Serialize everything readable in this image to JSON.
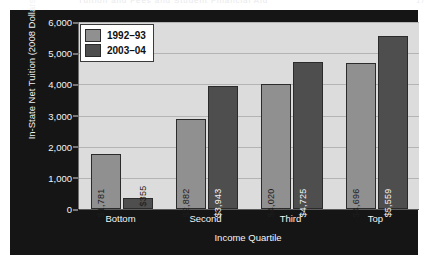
{
  "page_header": {
    "title": "Tuition and Fees and Student Financial Aid",
    "folio": "17"
  },
  "chart_data": {
    "type": "bar",
    "title": "",
    "subtitle": "",
    "xlabel": "Income Quartile",
    "ylabel": "In-State Net Tuition (2008 Dollars)",
    "categories": [
      "Bottom",
      "Second",
      "Third",
      "Top"
    ],
    "ylim": [
      0,
      6000
    ],
    "ytick_values": [
      0,
      1000,
      2000,
      3000,
      4000,
      5000,
      6000
    ],
    "ytick_labels": [
      "0",
      "1,000",
      "2,000",
      "3,000",
      "4,000",
      "5,000",
      "6,000"
    ],
    "grid": true,
    "legend_position": "top-left",
    "series": [
      {
        "name": "1992–93",
        "color": "#909090",
        "values": [
          1781,
          2882,
          4020,
          4696
        ],
        "labels": [
          "$1,781",
          "$2,882",
          "$4,020",
          "$4,696"
        ]
      },
      {
        "name": "2003–04",
        "color": "#4e4e4e",
        "values": [
          355,
          3943,
          4725,
          5559
        ],
        "labels": [
          "$355",
          "$3,943",
          "$4,725",
          "$5,559"
        ]
      }
    ]
  },
  "colors": {
    "frame": "#151515",
    "plot_background": "#dcdcdc",
    "gridline": "#b4b4b4",
    "series_1992": "#909090",
    "series_2003": "#4e4e4e",
    "axis_text": "#f4f4f4"
  }
}
